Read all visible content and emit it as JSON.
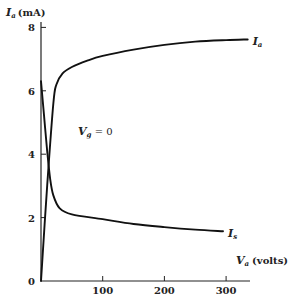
{
  "chart_data": {
    "type": "line",
    "title": "",
    "xlabel": {
      "symbol": "V",
      "subscript": "a",
      "unit": "(volts)"
    },
    "ylabel": {
      "symbol": "I",
      "subscript": "a",
      "unit": "(mA)"
    },
    "xlim": [
      0,
      350
    ],
    "ylim": [
      0,
      8.5
    ],
    "xticks": [
      100,
      200,
      300
    ],
    "xtick_labels": [
      "100",
      "200",
      "300"
    ],
    "yticks": [
      0,
      2,
      4,
      6,
      8
    ],
    "ytick_labels": [
      "0",
      "2",
      "4",
      "6",
      "8"
    ],
    "grid": false,
    "annotation": {
      "symbol": "V",
      "subscript": "g",
      "rest": " = 0",
      "x": 60,
      "y": 4.6
    },
    "series": [
      {
        "name": "I_a",
        "label": {
          "symbol": "I",
          "subscript": "a"
        },
        "x": [
          0,
          10,
          20,
          25,
          35,
          50,
          75,
          100,
          150,
          200,
          250,
          300,
          335
        ],
        "y": [
          0,
          3.0,
          5.6,
          6.2,
          6.55,
          6.75,
          6.95,
          7.1,
          7.3,
          7.45,
          7.55,
          7.6,
          7.62
        ]
      },
      {
        "name": "I_s",
        "label": {
          "symbol": "I",
          "subscript": "s"
        },
        "x": [
          0,
          5,
          10,
          15,
          20,
          30,
          50,
          100,
          150,
          200,
          250,
          295
        ],
        "y": [
          6.3,
          5.2,
          4.1,
          3.2,
          2.7,
          2.3,
          2.1,
          1.95,
          1.8,
          1.7,
          1.62,
          1.57
        ]
      }
    ]
  }
}
